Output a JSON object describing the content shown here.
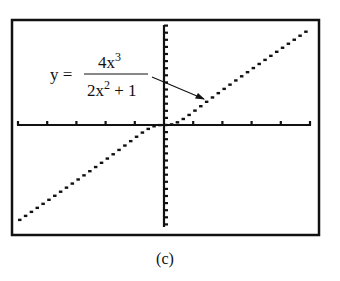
{
  "figure": {
    "caption": "(c)",
    "annotation": {
      "lhs": "y =",
      "numerator": "4x",
      "numerator_exp": "3",
      "denominator_a": "2x",
      "denominator_exp": "2",
      "denominator_b": " + 1"
    }
  },
  "colors": {
    "ink": "#111111",
    "background": "#ffffff"
  },
  "chart_data": {
    "type": "line",
    "title": "",
    "xlabel": "",
    "ylabel": "",
    "function": "y = 4x^3 / (2x^2 + 1)",
    "xlim": [
      -5,
      5
    ],
    "ylim": [
      -10.2,
      10.2
    ],
    "x_tick_step": 1,
    "x_ticks_each_side": 5,
    "y_ticks_each_side": 14,
    "grid": false,
    "legend": null,
    "annotations": [
      {
        "text": "y = 4x^3/(2x^2+1)",
        "arrow_to": [
          1.4,
          2.6
        ]
      }
    ],
    "series": [
      {
        "name": "y = 4x^3/(2x^2+1)",
        "x": [
          -5,
          -4,
          -3,
          -2,
          -1.5,
          -1,
          -0.5,
          0,
          0.5,
          1,
          1.5,
          2,
          3,
          4,
          5
        ],
        "values": [
          -9.8,
          -7.76,
          -5.68,
          -3.56,
          -2.45,
          -1.33,
          -0.33,
          0,
          0.33,
          1.33,
          2.45,
          3.56,
          5.68,
          7.76,
          9.8
        ]
      }
    ]
  },
  "layout": {
    "frame": {
      "x": 12,
      "y": 20,
      "w": 307,
      "h": 215
    },
    "origin_px": {
      "x": 164,
      "y": 125
    },
    "x_px_per_unit": 29.2,
    "y_px_per_unit": 9.8,
    "y_tick_px": 7.1,
    "y_axis_top": 25,
    "y_axis_bottom": 227,
    "x_axis_left": 17,
    "x_axis_right": 311
  }
}
